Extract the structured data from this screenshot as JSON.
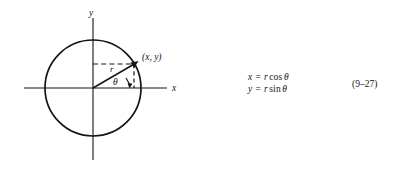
{
  "figure": {
    "axes": {
      "y_label": "y",
      "x_label": "x"
    },
    "point_label": "(x, y)",
    "radius_label": "r",
    "angle_label": "θ",
    "circle": {
      "center_x": 93,
      "center_y": 88,
      "radius": 48
    },
    "point": {
      "x": 135,
      "y": 64,
      "angle_degrees": 30
    }
  },
  "equations": {
    "line1": {
      "lhs": "x",
      "equals": "=",
      "rhs_var": "r",
      "rhs_fn": "cos",
      "rhs_angle": "θ",
      "plain": "x = r cos θ"
    },
    "line2": {
      "lhs": "y",
      "equals": "=",
      "rhs_var": "r",
      "rhs_fn": "sin",
      "rhs_angle": "θ",
      "plain": "y = r sin θ"
    },
    "number": "(9–27)"
  },
  "colors": {
    "ink": "#141414",
    "background": "#ffffff"
  }
}
